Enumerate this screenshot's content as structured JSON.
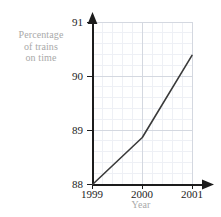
{
  "chart_data": {
    "type": "line",
    "title": "",
    "xlabel": "Year",
    "ylabel": "Percentage of trains on time",
    "ylabel_lines": [
      "Percentage",
      "of trains",
      "on time"
    ],
    "x": [
      1999,
      2000,
      2001
    ],
    "xtick_labels": [
      "1999",
      "2000",
      "2001"
    ],
    "ytick_labels": [
      "88",
      "89",
      "90",
      "91"
    ],
    "values": [
      88.0,
      88.87,
      90.39
    ],
    "series": [
      {
        "name": "Percentage of trains on time",
        "values": [
          88.0,
          88.87,
          90.39
        ]
      }
    ],
    "xlim": [
      1999,
      2001
    ],
    "ylim": [
      88,
      91
    ],
    "grid": true,
    "minor_grid": true,
    "minor_divisions_x": 5,
    "minor_divisions_y": 5,
    "legend": "none",
    "line_color": "#3a3a3a",
    "grid_color": "#d8dce4",
    "minor_grid_color": "#eef0f5",
    "axis_color": "#1c1c1c",
    "label_color": "#a9a9a9",
    "tick_color": "#1c1c1c",
    "background": "#ffffff"
  },
  "axes": {
    "y_ticks": [
      {
        "label": "91",
        "value": 91
      },
      {
        "label": "90",
        "value": 90
      },
      {
        "label": "89",
        "value": 89
      },
      {
        "label": "88",
        "value": 88
      }
    ],
    "x_ticks": [
      {
        "label": "1999",
        "value": 1999
      },
      {
        "label": "2000",
        "value": 2000
      },
      {
        "label": "2001",
        "value": 2001
      }
    ]
  }
}
